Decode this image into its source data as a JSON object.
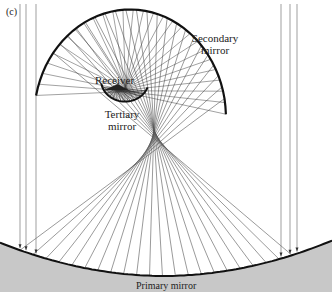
{
  "figure": {
    "panel_label": "(c)",
    "labels": {
      "receiver": "Receiver",
      "tertiary_line1": "Tertiary",
      "tertiary_line2": "mirror",
      "secondary_line1": "Secondary",
      "secondary_line2": "mirror",
      "primary": "Primary mirror"
    },
    "colors": {
      "background": "#ffffff",
      "primary_fill": "#c8c8c8",
      "mirror_stroke": "#111111",
      "ray_stroke": "#555555"
    },
    "components": [
      "Primary mirror",
      "Secondary mirror",
      "Tertiary mirror",
      "Receiver"
    ],
    "incoming_ray_count_left": 3,
    "incoming_ray_count_right": 3
  }
}
